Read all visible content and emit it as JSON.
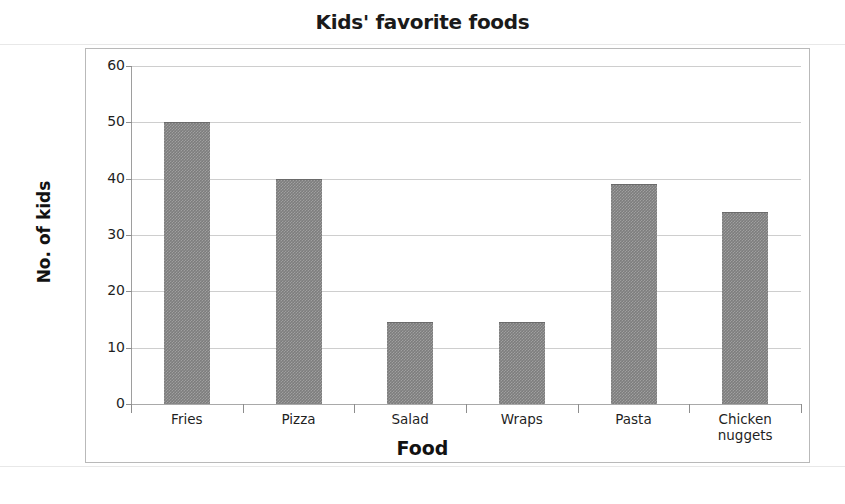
{
  "chart_data": {
    "type": "bar",
    "title": "Kids' favorite foods",
    "xlabel": "Food",
    "ylabel": "No. of kids",
    "categories": [
      "Fries",
      "Pizza",
      "Salad",
      "Wraps",
      "Pasta",
      "Chicken nuggets"
    ],
    "values": [
      50,
      40,
      14.5,
      14.5,
      39,
      34
    ],
    "ylim": [
      0,
      60
    ],
    "ytick_labels": [
      "0",
      "10",
      "20",
      "30",
      "40",
      "50",
      "60"
    ],
    "ytick_values": [
      0,
      10,
      20,
      30,
      40,
      50,
      60
    ],
    "grid": true,
    "legend": "none",
    "bar_color": "#7d7d7d",
    "gridline_color": "#c6c6c6",
    "axis_color": "#9e9e9e",
    "text_color": "#1f1f1f"
  },
  "categories_display": [
    {
      "label": "Fries"
    },
    {
      "label": "Pizza"
    },
    {
      "label": "Salad"
    },
    {
      "label": "Wraps"
    },
    {
      "label": "Pasta"
    },
    {
      "label": "Chicken nuggets"
    }
  ],
  "ticks": [
    {
      "label": "60"
    },
    {
      "label": "50"
    },
    {
      "label": "40"
    },
    {
      "label": "30"
    },
    {
      "label": "20"
    },
    {
      "label": "10"
    },
    {
      "label": "0"
    }
  ]
}
